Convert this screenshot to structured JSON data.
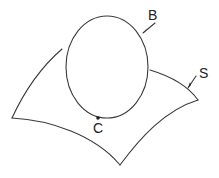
{
  "diagram": {
    "type": "surface-with-boundary-curve",
    "labels": {
      "boundary_curve": "B",
      "point": "C",
      "surface": "S"
    },
    "colors": {
      "line": "#3a3a3a",
      "text": "#222222",
      "background": "#ffffff"
    }
  }
}
